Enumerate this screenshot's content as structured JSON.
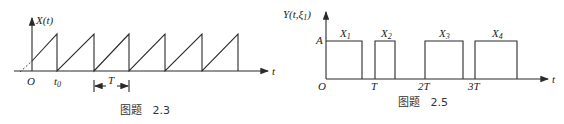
{
  "figures": [
    {
      "id": "fig-2-3",
      "caption": "图题   2.3",
      "y_label": "X(t)",
      "x_label": "t",
      "origin_label": "O",
      "t0_label": "t",
      "t0_sub": "0",
      "period_label": "T",
      "description": "Periodic sawtooth waveform starting at t0 with period T"
    },
    {
      "id": "fig-2-5",
      "caption": "图题   2.5",
      "y_label": "Y(t,ξ",
      "y_label_sub": "1",
      "y_label_close": ")",
      "x_label": "t",
      "origin_label": "O",
      "level_label": "A",
      "ticks": [
        "T",
        "2T",
        "3T"
      ],
      "pulses": [
        {
          "label": "X",
          "sub": "1"
        },
        {
          "label": "X",
          "sub": "2"
        },
        {
          "label": "X",
          "sub": "3"
        },
        {
          "label": "X",
          "sub": "4"
        }
      ]
    }
  ]
}
